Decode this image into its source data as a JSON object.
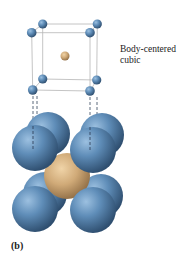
{
  "diagram": {
    "label_line1": "Body-centered",
    "label_line2": "cubic",
    "panel_label": "(b)",
    "colors": {
      "corner_atom": "#5a86b0",
      "center_atom": "#c9a878",
      "cell_edges": "#b0b0b0",
      "dashed_lines": "#3a4a60"
    }
  }
}
